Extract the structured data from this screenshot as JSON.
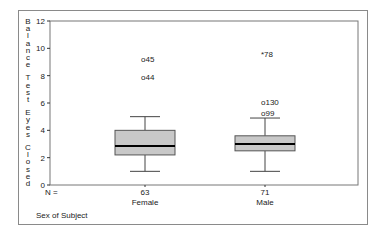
{
  "chart_data": {
    "type": "boxplot",
    "title": "",
    "xlabel": "Sex of Subject",
    "ylabel": "Balance Test Eyes Closed",
    "ylim": [
      0,
      12
    ],
    "yticks": [
      0,
      2,
      4,
      6,
      8,
      10,
      12
    ],
    "categories": [
      "Female",
      "Male"
    ],
    "n_label": "N =",
    "n": [
      63,
      71
    ],
    "boxes": [
      {
        "name": "Female",
        "whisker_low": 1.0,
        "q1": 2.2,
        "median": 2.85,
        "q3": 4.0,
        "whisker_high": 5.0,
        "outliers": [
          {
            "id": "45",
            "value": 9.2,
            "marker": "o"
          },
          {
            "id": "44",
            "value": 7.9,
            "marker": "o"
          }
        ]
      },
      {
        "name": "Male",
        "whisker_low": 1.0,
        "q1": 2.5,
        "median": 3.0,
        "q3": 3.6,
        "whisker_high": 4.9,
        "outliers": [
          {
            "id": "78",
            "value": 9.6,
            "marker": "*"
          },
          {
            "id": "130",
            "value": 6.1,
            "marker": "o"
          },
          {
            "id": "99",
            "value": 5.3,
            "marker": "o"
          }
        ]
      }
    ],
    "grid": false,
    "box_color": "#c8c8c8"
  }
}
